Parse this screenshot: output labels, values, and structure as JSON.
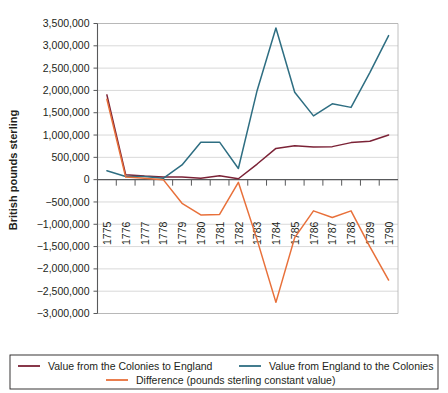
{
  "chart_data": {
    "type": "line",
    "title": "",
    "xlabel": "",
    "ylabel": "British pounds sterling",
    "categories": [
      "1775",
      "1776",
      "1777",
      "1778",
      "1779",
      "1780",
      "1781",
      "1782",
      "1783",
      "1784",
      "1785",
      "1786",
      "1787",
      "1788",
      "1789",
      "1790"
    ],
    "ylim": [
      -3000000,
      3500000
    ],
    "ytick_labels": [
      "3,500,000",
      "3,000,000",
      "2,500,000",
      "2,000,000",
      "1,500,000",
      "1,000,000",
      "500,000",
      "0",
      "−500,000",
      "−1,000,000",
      "−1,500,000",
      "−2,000,000",
      "−2,500,000",
      "−3,000,000"
    ],
    "ytick_values": [
      3500000,
      3000000,
      2500000,
      2000000,
      1500000,
      1000000,
      500000,
      0,
      -500000,
      -1000000,
      -1500000,
      -2000000,
      -2500000,
      -3000000
    ],
    "grid": true,
    "legend_position": "bottom",
    "series": [
      {
        "name": "Value from the Colonies to England",
        "color": "#7b2236",
        "values": [
          1900000,
          110000,
          80000,
          60000,
          60000,
          30000,
          90000,
          20000,
          350000,
          700000,
          760000,
          730000,
          740000,
          830000,
          860000,
          1000000
        ]
      },
      {
        "name": "Value from England to the Colonies",
        "color": "#2e6e82",
        "values": [
          200000,
          70000,
          70000,
          30000,
          330000,
          840000,
          840000,
          250000,
          2000000,
          3400000,
          1960000,
          1430000,
          1700000,
          1620000,
          2400000,
          3230000
        ]
      },
      {
        "name": "Difference (pounds sterling constant value)",
        "color": "#e8703a",
        "values": [
          1800000,
          60000,
          30000,
          0,
          -530000,
          -790000,
          -780000,
          -60000,
          -1350000,
          -2750000,
          -1300000,
          -700000,
          -850000,
          -700000,
          -1500000,
          -2250000
        ]
      }
    ]
  },
  "legend": {
    "items": [
      {
        "label": "Value from the Colonies to England",
        "color": "#7b2236"
      },
      {
        "label": "Value from England to the Colonies",
        "color": "#2e6e82"
      },
      {
        "label": "Difference (pounds sterling constant value)",
        "color": "#e8703a"
      }
    ]
  }
}
